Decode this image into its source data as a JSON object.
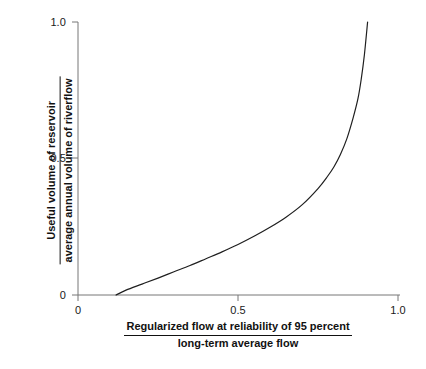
{
  "chart_data": {
    "type": "line",
    "title": "",
    "xlabel_numerator": "Regularized flow at reliability of 95 percent",
    "xlabel_denominator": "long-term average flow",
    "ylabel_numerator": "Useful volume of reservoir",
    "ylabel_denominator": "average annual volume of riverflow",
    "xlim": [
      0,
      1.0
    ],
    "ylim": [
      0,
      1.0
    ],
    "xticks": [
      "0",
      "0.5",
      "1.0"
    ],
    "xtick_values": [
      0,
      0.5,
      1.0
    ],
    "yticks": [
      "0",
      "0.5",
      "1.0"
    ],
    "ytick_values": [
      0,
      0.5,
      1.0
    ],
    "grid": false,
    "legend": "none",
    "line_color": "#1f1f1f",
    "axis_color": "#6b6b6b",
    "series": [
      {
        "name": "storage-yield curve",
        "x": [
          0.119,
          0.15,
          0.2,
          0.25,
          0.3,
          0.35,
          0.4,
          0.45,
          0.5,
          0.55,
          0.6,
          0.65,
          0.7,
          0.75,
          0.78,
          0.8,
          0.82,
          0.84,
          0.86,
          0.875,
          0.885,
          0.895,
          0.905
        ],
        "y": [
          0.0,
          0.018,
          0.04,
          0.062,
          0.085,
          0.108,
          0.133,
          0.158,
          0.185,
          0.215,
          0.248,
          0.285,
          0.33,
          0.39,
          0.435,
          0.47,
          0.515,
          0.572,
          0.65,
          0.72,
          0.79,
          0.88,
          1.0
        ]
      }
    ]
  },
  "axes": {
    "x_ticks": [
      {
        "label": "0",
        "value": 0
      },
      {
        "label": "0.5",
        "value": 0.5
      },
      {
        "label": "1.0",
        "value": 1.0
      }
    ],
    "y_ticks": [
      {
        "label": "0",
        "value": 0
      },
      {
        "label": "0.5",
        "value": 0.5
      },
      {
        "label": "1.0",
        "value": 1.0
      }
    ]
  }
}
